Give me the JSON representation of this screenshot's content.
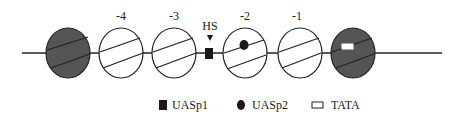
{
  "diagram": {
    "colors": {
      "line": "#222222",
      "dark_fill": "#555555",
      "light_fill": "#ffffff",
      "marker": "#1a1a1a"
    },
    "nucleosomes": [
      {
        "id": "n-left",
        "label": "",
        "dark": true
      },
      {
        "id": "n-minus4",
        "label": "-4",
        "dark": false
      },
      {
        "id": "n-minus3",
        "label": "-3",
        "dark": false
      },
      {
        "id": "n-minus2",
        "label": "-2",
        "dark": false,
        "contains": "UASp2"
      },
      {
        "id": "n-minus1",
        "label": "-1",
        "dark": false
      },
      {
        "id": "n-right",
        "label": "",
        "dark": true,
        "contains": "TATA"
      }
    ],
    "hs_site": {
      "label": "HS",
      "marker": "UASp1"
    },
    "legend": [
      {
        "symbol": "filled-square",
        "label": "UASp1"
      },
      {
        "symbol": "filled-circle",
        "label": "UASp2"
      },
      {
        "symbol": "open-rectangle",
        "label": "TATA"
      }
    ]
  }
}
